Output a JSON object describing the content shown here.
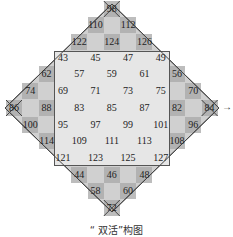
{
  "diagram": {
    "caption": "“ 双活”构图",
    "arrow": "→",
    "colors": {
      "outer_cell": "#bdbdbd",
      "inner_square": "#e6e6e6",
      "diamond": "#a9a9a9",
      "lines": "#444444"
    },
    "crossed_cells": [
      "98",
      "86",
      "84",
      "72"
    ],
    "rows": [
      {
        "y": 9,
        "cells": [
          {
            "col": 6,
            "v": "98"
          }
        ]
      },
      {
        "y": 25,
        "cells": [
          {
            "col": 5,
            "v": "110"
          },
          {
            "col": 7,
            "v": "112"
          }
        ]
      },
      {
        "y": 42,
        "cells": [
          {
            "col": 4,
            "v": "122"
          },
          {
            "col": 6,
            "v": "124"
          },
          {
            "col": 8,
            "v": "126"
          }
        ]
      },
      {
        "y": 58,
        "cells": [
          {
            "col": 3,
            "v": "43"
          },
          {
            "col": 5,
            "v": "45"
          },
          {
            "col": 7,
            "v": "47"
          },
          {
            "col": 9,
            "v": "49"
          }
        ]
      },
      {
        "y": 74,
        "cells": [
          {
            "col": 2,
            "v": "62"
          },
          {
            "col": 4,
            "v": "57"
          },
          {
            "col": 6,
            "v": "59"
          },
          {
            "col": 8,
            "v": "61"
          },
          {
            "col": 10,
            "v": "56"
          }
        ]
      },
      {
        "y": 91,
        "cells": [
          {
            "col": 1,
            "v": "74"
          },
          {
            "col": 3,
            "v": "69"
          },
          {
            "col": 5,
            "v": "71"
          },
          {
            "col": 7,
            "v": "73"
          },
          {
            "col": 9,
            "v": "75"
          },
          {
            "col": 11,
            "v": "70"
          }
        ]
      },
      {
        "y": 108,
        "cells": [
          {
            "col": 0,
            "v": "86"
          },
          {
            "col": 2,
            "v": "88"
          },
          {
            "col": 4,
            "v": "83"
          },
          {
            "col": 6,
            "v": "85"
          },
          {
            "col": 8,
            "v": "87"
          },
          {
            "col": 10,
            "v": "82"
          },
          {
            "col": 12,
            "v": "84"
          }
        ]
      },
      {
        "y": 125,
        "cells": [
          {
            "col": 1,
            "v": "100"
          },
          {
            "col": 3,
            "v": "95"
          },
          {
            "col": 5,
            "v": "97"
          },
          {
            "col": 7,
            "v": "99"
          },
          {
            "col": 9,
            "v": "101"
          },
          {
            "col": 11,
            "v": "96"
          }
        ]
      },
      {
        "y": 141,
        "cells": [
          {
            "col": 2,
            "v": "114"
          },
          {
            "col": 4,
            "v": "109"
          },
          {
            "col": 6,
            "v": "111"
          },
          {
            "col": 8,
            "v": "113"
          },
          {
            "col": 10,
            "v": "108"
          }
        ]
      },
      {
        "y": 158,
        "cells": [
          {
            "col": 3,
            "v": "121"
          },
          {
            "col": 5,
            "v": "123"
          },
          {
            "col": 7,
            "v": "125"
          },
          {
            "col": 9,
            "v": "127"
          }
        ]
      },
      {
        "y": 175,
        "cells": [
          {
            "col": 4,
            "v": "44"
          },
          {
            "col": 6,
            "v": "46"
          },
          {
            "col": 8,
            "v": "48"
          }
        ]
      },
      {
        "y": 191,
        "cells": [
          {
            "col": 5,
            "v": "58"
          },
          {
            "col": 7,
            "v": "60"
          }
        ]
      },
      {
        "y": 208,
        "cells": [
          {
            "col": 6,
            "v": "72"
          }
        ]
      }
    ]
  }
}
